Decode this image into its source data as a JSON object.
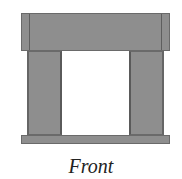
{
  "diagram": {
    "caption": "Front",
    "view": "front elevation",
    "parts": [
      {
        "name": "top-beam"
      },
      {
        "name": "left-leg"
      },
      {
        "name": "right-leg"
      },
      {
        "name": "base"
      }
    ],
    "colors": {
      "fill": "#8e8e8e",
      "outline": "#6a6a6a",
      "background": "#ffffff"
    }
  }
}
